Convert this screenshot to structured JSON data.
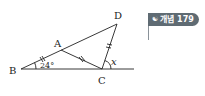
{
  "diagram": {
    "points": {
      "B": {
        "label": "B",
        "x": 21,
        "y": 69
      },
      "A": {
        "label": "A",
        "x": 61,
        "y": 50
      },
      "D": {
        "label": "D",
        "x": 117,
        "y": 24
      },
      "C": {
        "label": "C",
        "x": 102,
        "y": 69
      }
    },
    "angle_B": "24°",
    "angle_x": "x",
    "equal_marks": [
      "BA",
      "AC",
      "CD"
    ]
  },
  "badge": {
    "icon": "concept-icon",
    "label": "개념 179"
  },
  "colors": {
    "line": "#222222",
    "badge_bg": "#5f6b73"
  }
}
